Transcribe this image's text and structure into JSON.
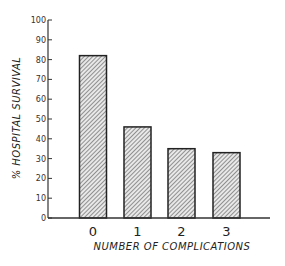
{
  "chart_data": {
    "type": "bar",
    "title": "",
    "xlabel": "NUMBER OF COMPLICATIONS",
    "ylabel": "% HOSPITAL SURVIVAL",
    "categories": [
      "0",
      "1",
      "2",
      "3"
    ],
    "values": [
      82,
      46,
      35,
      33
    ],
    "ylim": [
      0,
      100
    ],
    "yticks": [
      0,
      10,
      20,
      30,
      40,
      50,
      60,
      70,
      80,
      90,
      100
    ],
    "grid": false,
    "legend": null,
    "bar_fill": "hatched diagonal",
    "colors": {
      "bar_outline": "#222222",
      "hatch": "#555555",
      "axis": "#333333"
    }
  }
}
